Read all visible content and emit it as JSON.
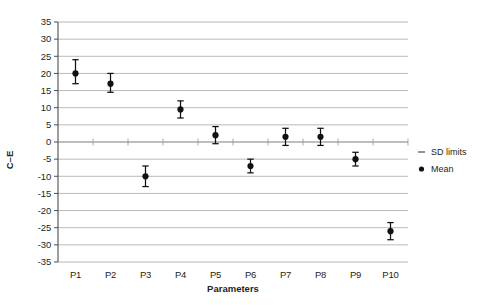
{
  "chart_data": {
    "type": "scatter",
    "title": "",
    "xlabel": "Parameters",
    "ylabel": "C–E",
    "categories": [
      "P1",
      "P2",
      "P3",
      "P4",
      "P5",
      "P6",
      "P7",
      "P8",
      "P9",
      "P10"
    ],
    "ylim": [
      -35,
      35
    ],
    "yticks": [
      35,
      30,
      25,
      20,
      15,
      10,
      5,
      0,
      -5,
      -10,
      -15,
      -20,
      -25,
      -30,
      -35
    ],
    "ytick_labels": [
      "35",
      "30",
      "25",
      "20",
      "15",
      "10",
      "5",
      "0",
      "-5",
      "-10",
      "-15",
      "-20",
      "-25",
      "-30",
      "-35"
    ],
    "grid": true,
    "legend_position": "right",
    "series": [
      {
        "name": "Mean",
        "marker": "filled-circle",
        "values": [
          20,
          17,
          -10,
          9.5,
          2,
          -7,
          1.5,
          1.5,
          -5,
          -26
        ]
      },
      {
        "name": "SD limits",
        "marker": "dash",
        "upper": [
          24,
          20,
          -7,
          12,
          4.5,
          -5,
          4,
          4,
          -3,
          -23.5
        ],
        "lower": [
          17,
          14.5,
          -13,
          7,
          -0.5,
          -9,
          -1,
          -1,
          -7,
          -28.5
        ]
      }
    ],
    "points": [
      {
        "x": "P1",
        "mean": 20,
        "sd_upper": 24,
        "sd_lower": 17
      },
      {
        "x": "P2",
        "mean": 17,
        "sd_upper": 20,
        "sd_lower": 14.5
      },
      {
        "x": "P3",
        "mean": -10,
        "sd_upper": -7,
        "sd_lower": -13
      },
      {
        "x": "P4",
        "mean": 9.5,
        "sd_upper": 12,
        "sd_lower": 7
      },
      {
        "x": "P5",
        "mean": 2,
        "sd_upper": 4.5,
        "sd_lower": -0.5
      },
      {
        "x": "P6",
        "mean": -7,
        "sd_upper": -5,
        "sd_lower": -9
      },
      {
        "x": "P7",
        "mean": 1.5,
        "sd_upper": 4,
        "sd_lower": -1
      },
      {
        "x": "P8",
        "mean": 1.5,
        "sd_upper": 4,
        "sd_lower": -1
      },
      {
        "x": "P9",
        "mean": -5,
        "sd_upper": -3,
        "sd_lower": -7
      },
      {
        "x": "P10",
        "mean": -26,
        "sd_upper": -23.5,
        "sd_lower": -28.5
      }
    ],
    "legend": [
      {
        "label": "SD limits",
        "marker": "dash"
      },
      {
        "label": "Mean",
        "marker": "filled-circle"
      }
    ],
    "colors": {
      "marker": "#111111",
      "gridline": "#9a9a9a",
      "axis": "#4d4d4d",
      "text": "#231f20",
      "background": "#ffffff"
    }
  }
}
